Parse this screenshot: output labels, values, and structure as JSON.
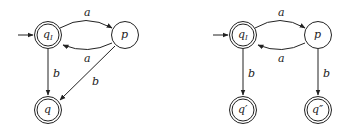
{
  "diagrams": [
    {
      "id": "left",
      "states": [
        {
          "id": "qI",
          "label": "qI",
          "initial": true,
          "accepting": true
        },
        {
          "id": "p",
          "label": "p",
          "initial": false,
          "accepting": false
        },
        {
          "id": "q",
          "label": "q",
          "initial": false,
          "accepting": true
        }
      ],
      "transitions": [
        {
          "from": "qI",
          "to": "p",
          "label": "a"
        },
        {
          "from": "p",
          "to": "qI",
          "label": "a"
        },
        {
          "from": "qI",
          "to": "q",
          "label": "b"
        },
        {
          "from": "p",
          "to": "q",
          "label": "b"
        }
      ]
    },
    {
      "id": "right",
      "states": [
        {
          "id": "qI",
          "label": "qI",
          "initial": true,
          "accepting": true
        },
        {
          "id": "p",
          "label": "p",
          "initial": false,
          "accepting": false
        },
        {
          "id": "q1",
          "label": "q′",
          "initial": false,
          "accepting": true
        },
        {
          "id": "q2",
          "label": "q″",
          "initial": false,
          "accepting": true
        }
      ],
      "transitions": [
        {
          "from": "qI",
          "to": "p",
          "label": "a"
        },
        {
          "from": "p",
          "to": "qI",
          "label": "a"
        },
        {
          "from": "qI",
          "to": "q1",
          "label": "b"
        },
        {
          "from": "p",
          "to": "q2",
          "label": "b"
        }
      ]
    }
  ],
  "labels": {
    "left_qI_main": "q",
    "left_qI_sub": "I",
    "left_p": "p",
    "left_q": "q",
    "left_a_top": "a",
    "left_a_bottom": "a",
    "left_b_vertical": "b",
    "left_b_diagonal": "b",
    "right_qI_main": "q",
    "right_qI_sub": "I",
    "right_p": "p",
    "right_q1": "q′",
    "right_q2": "q″",
    "right_a_top": "a",
    "right_a_bottom": "a",
    "right_b_left": "b",
    "right_b_right": "b"
  }
}
